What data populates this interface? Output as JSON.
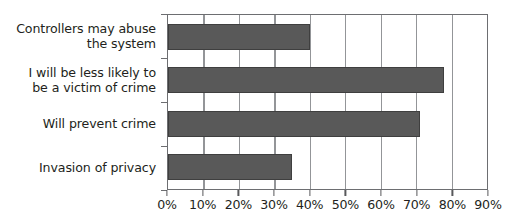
{
  "chart_data": {
    "type": "bar",
    "orientation": "horizontal",
    "title": "",
    "xlabel": "",
    "ylabel": "",
    "categories": [
      "Controllers may abuse\nthe system",
      "I will be less likely to\nbe a victim of crime",
      "Will prevent crime",
      "Invasion of privacy"
    ],
    "values": [
      40,
      78,
      71,
      35
    ],
    "value_suffix": "%",
    "xlim": [
      0,
      90
    ],
    "xticks": [
      0,
      10,
      20,
      30,
      40,
      50,
      60,
      70,
      80,
      90
    ],
    "xtick_labels": [
      "0%",
      "10%",
      "20%",
      "30%",
      "40%",
      "50%",
      "60%",
      "70%",
      "80%",
      "90%"
    ],
    "grid": "vertical",
    "legend": "none",
    "colors": {
      "bar_fill": "#595959",
      "bar_border": "#3f3f3f",
      "gridline": "#939598",
      "axis": "#6d6e71",
      "text": "#231f20",
      "plot_background": "#ffffff"
    }
  }
}
